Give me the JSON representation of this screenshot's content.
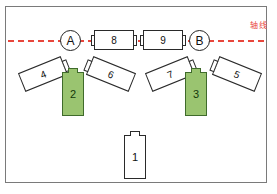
{
  "diagram": {
    "background_color": "#ffffff",
    "frame_color": "#7a7a7a",
    "axis": {
      "label": "轴线",
      "color": "#e8463c",
      "style": "dashed"
    },
    "colors": {
      "green_fill": "#9ac470",
      "green_stroke": "#3f6b2b",
      "outline": "#2a2a2a",
      "accent_red": "#e8463c"
    },
    "nodes": [
      {
        "id": "A",
        "label": "A",
        "shape": "circle",
        "on_axis": true
      },
      {
        "id": "B",
        "label": "B",
        "shape": "circle",
        "on_axis": true
      }
    ],
    "axis_bodies": [
      {
        "id": "8",
        "label": "8",
        "shape": "horizontal-rect",
        "fill": "white"
      },
      {
        "id": "9",
        "label": "9",
        "shape": "horizontal-rect",
        "fill": "white"
      }
    ],
    "vertical_bodies": [
      {
        "id": "2",
        "label": "2",
        "shape": "vertical-rect",
        "fill": "green"
      },
      {
        "id": "3",
        "label": "3",
        "shape": "vertical-rect",
        "fill": "green"
      },
      {
        "id": "1",
        "label": "1",
        "shape": "vertical-rect",
        "fill": "white"
      }
    ],
    "tilted_bodies": [
      {
        "id": "4",
        "label": "4",
        "shape": "tilted-rect",
        "rotation_deg": -22,
        "cap": "right"
      },
      {
        "id": "6",
        "label": "6",
        "shape": "tilted-rect",
        "rotation_deg": 22,
        "cap": "left"
      },
      {
        "id": "7",
        "label": "7",
        "shape": "tilted-rect",
        "rotation_deg": -22,
        "cap": "right"
      },
      {
        "id": "5",
        "label": "5",
        "shape": "tilted-rect",
        "rotation_deg": 22,
        "cap": "left"
      }
    ]
  }
}
